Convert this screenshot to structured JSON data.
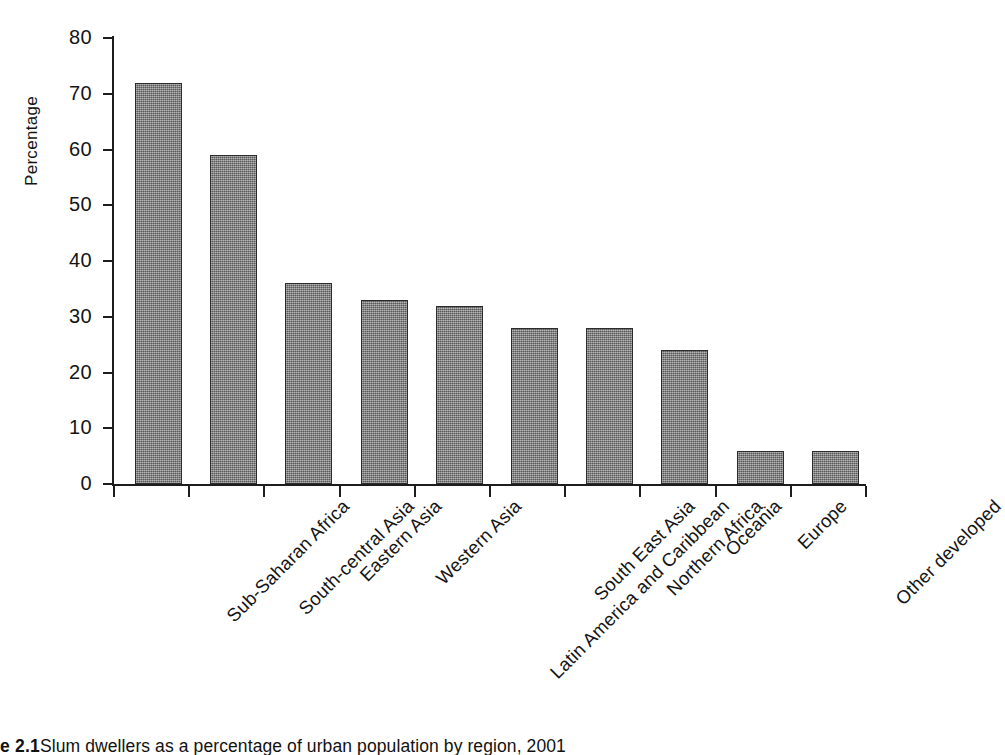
{
  "chart_data": {
    "type": "bar",
    "title": "",
    "xlabel": "",
    "ylabel": "Percentage",
    "ylim": [
      0,
      80
    ],
    "yticks": [
      0,
      10,
      20,
      30,
      40,
      50,
      60,
      70,
      80
    ],
    "ytick_labels": [
      "0",
      "10",
      "20",
      "30",
      "40",
      "50",
      "60",
      "70",
      "80"
    ],
    "grid": false,
    "legend": false,
    "legend_position": "none",
    "bar_color": "#7c7c7c",
    "bar_edge_color": "#2b2b2b",
    "categories": [
      "Sub-Saharan Africa",
      "South-central Asia",
      "Eastern Asia",
      "Western Asia",
      "Latin America and Caribbean",
      "South East Asia",
      "Northern Africa",
      "Oceania",
      "Europe",
      "Other developed"
    ],
    "values": [
      72,
      59,
      36,
      33,
      32,
      28,
      28,
      24,
      6,
      6
    ]
  },
  "caption": {
    "figure_number": "e 2.1",
    "text": "Slum dwellers as a percentage of urban population by region, 2001"
  },
  "axis": {
    "y_title": "Percentage"
  }
}
